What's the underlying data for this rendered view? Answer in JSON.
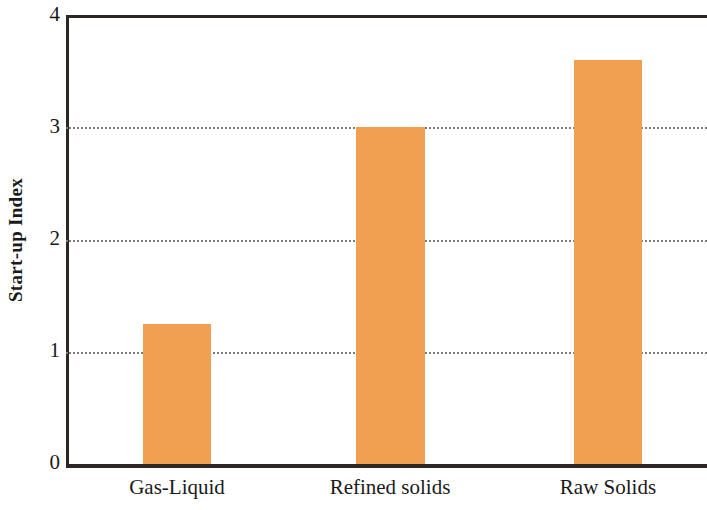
{
  "chart_data": {
    "type": "bar",
    "title": "",
    "subtitle": "",
    "xlabel": "",
    "ylabel": "Start-up Index",
    "categories": [
      "Gas-Liquid",
      "Refined solids",
      "Raw Solids"
    ],
    "values": [
      1.25,
      3.0,
      3.6
    ],
    "series": [
      {
        "name": "Start-up Index",
        "values": [
          1.25,
          3.0,
          3.6
        ],
        "color": "#f0a050"
      }
    ],
    "ylim": [
      0,
      4
    ],
    "xlim": [
      0,
      3
    ],
    "y_ticks": [
      "0",
      "1",
      "2",
      "3",
      "4"
    ],
    "y_tick_values": [
      0,
      1,
      2,
      3,
      4
    ],
    "gridlines": {
      "horizontal": [
        1,
        2,
        3
      ],
      "vertical": [],
      "style": "dotted",
      "color": "#7c7c7c"
    },
    "legend": {
      "visible": false,
      "position": "none",
      "entries": []
    },
    "annotations": [],
    "axis_color": "#2b2724",
    "background_color": "#ffffff"
  },
  "axes": {
    "y_title": "Start-up Index",
    "y_tick_labels": [
      "4",
      "3",
      "2",
      "1",
      "0"
    ],
    "x_tick_labels": [
      "Gas-Liquid",
      "Refined solids",
      "Raw Solids"
    ]
  }
}
